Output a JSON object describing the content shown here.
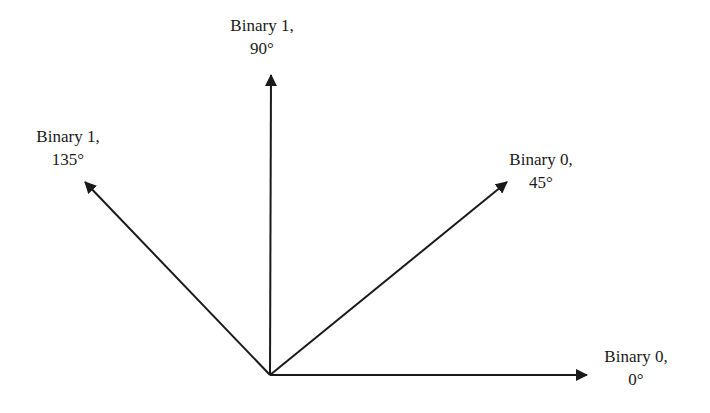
{
  "diagram": {
    "type": "phase-vector-diagram",
    "stroke_color": "#1a1a1a",
    "background": "#ffffff",
    "origin": {
      "x": 270,
      "y": 375
    },
    "vectors": [
      {
        "id": "v0",
        "binary": "Binary 0,",
        "angle_label": "0°",
        "angle_deg": 0,
        "tip": {
          "x": 587,
          "y": 375
        },
        "label_pos": {
          "x": 636,
          "y": 345
        }
      },
      {
        "id": "v45",
        "binary": "Binary 0,",
        "angle_label": "45°",
        "angle_deg": 45,
        "tip": {
          "x": 507,
          "y": 182
        },
        "label_pos": {
          "x": 541,
          "y": 148
        }
      },
      {
        "id": "v90",
        "binary": "Binary 1,",
        "angle_label": "90°",
        "angle_deg": 90,
        "tip": {
          "x": 271,
          "y": 75
        },
        "label_pos": {
          "x": 262,
          "y": 14
        }
      },
      {
        "id": "v135",
        "binary": "Binary 1,",
        "angle_label": "135°",
        "angle_deg": 135,
        "tip": {
          "x": 85,
          "y": 182
        },
        "label_pos": {
          "x": 68,
          "y": 125
        }
      }
    ]
  }
}
